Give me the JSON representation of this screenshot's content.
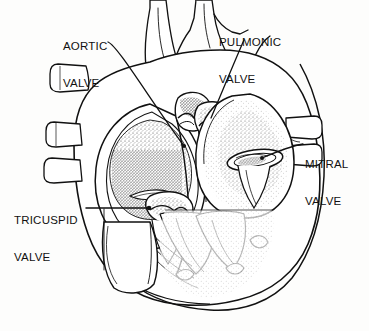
{
  "figure": {
    "caption": "",
    "style": "black and white line drawing with stippled shading",
    "width": 369,
    "height": 331,
    "background_color": "#fdfdfc",
    "ink_color": "#111111"
  },
  "labels": [
    {
      "id": "aortic-valve",
      "line1": "AORTIC",
      "line2": "VALVE",
      "leader": "diagonal line from label down-right to valve",
      "target_x": 184,
      "target_y": 146
    },
    {
      "id": "pulmonic-valve",
      "line1": "PULMONIC",
      "line2": "VALVE",
      "leader": "diagonal line from label down-left to valve",
      "target_x": 211,
      "target_y": 118
    },
    {
      "id": "mitral-valve",
      "line1": "MITRAL",
      "line2": "VALVE",
      "leader": "line from label left to valve ring",
      "target_x": 262,
      "target_y": 158
    },
    {
      "id": "tricuspid-valve",
      "line1": "TRICUSPID",
      "line2": "VALVE",
      "leader": "horizontal line from label right to valve",
      "target_x": 149,
      "target_y": 208
    }
  ],
  "anatomy": {
    "great_vessels": "aorta and pulmonary trunk rising from top of heart",
    "left_atrium": "stippled chamber at upper left with pulmonary vein stubs",
    "right_atrium": "chamber at upper right",
    "left_ventricle": "large chamber lower center-right with trabeculae",
    "right_ventricle": "chamber lower left",
    "pulmonary_vein_stubs_left": 3,
    "pulmonary_vein_stubs_right": 2,
    "papillary_muscles": "visible in ventricle with chordae tendineae"
  }
}
